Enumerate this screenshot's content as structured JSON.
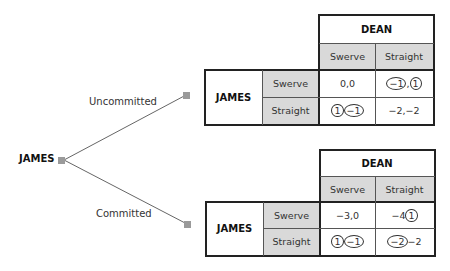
{
  "tree": {
    "root": {
      "label": "JAMES"
    },
    "branches": [
      {
        "label": "Uncommitted"
      },
      {
        "label": "Committed"
      }
    ]
  },
  "games": [
    {
      "column_player": "DEAN",
      "row_player": "JAMES",
      "column_strategies": [
        "Swerve",
        "Straight"
      ],
      "row_strategies": [
        "Swerve",
        "Straight"
      ],
      "payoffs": [
        [
          {
            "a": "0",
            "sep": ", ",
            "b": "0",
            "circle_a": false,
            "circle_b": false
          },
          {
            "a": "−1",
            "sep": ",",
            "b": "1",
            "circle_a": true,
            "circle_b": true
          }
        ],
        [
          {
            "a": "1",
            "sep": "",
            "b": "−1",
            "circle_a": true,
            "circle_b": true
          },
          {
            "a": "−2",
            "sep": ", ",
            "b": "−2",
            "circle_a": false,
            "circle_b": false
          }
        ]
      ]
    },
    {
      "column_player": "DEAN",
      "row_player": "JAMES",
      "column_strategies": [
        "Swerve",
        "Straight"
      ],
      "row_strategies": [
        "Swerve",
        "Straight"
      ],
      "payoffs": [
        [
          {
            "a": "−3",
            "sep": ", ",
            "b": "0",
            "circle_a": false,
            "circle_b": false
          },
          {
            "a": "−4",
            "sep": "",
            "b": "1",
            "circle_a": false,
            "circle_b": true
          }
        ],
        [
          {
            "a": "1",
            "sep": "",
            "b": "−1",
            "circle_a": true,
            "circle_b": true
          },
          {
            "a": "−2",
            "sep": "",
            "b": "−2",
            "circle_a": true,
            "circle_b": false
          }
        ]
      ]
    }
  ]
}
